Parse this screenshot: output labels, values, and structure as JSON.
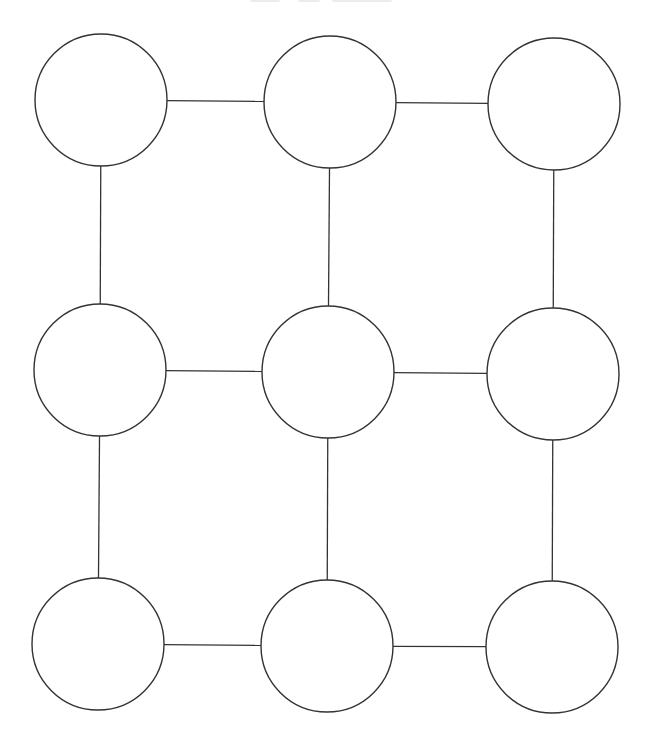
{
  "diagram": {
    "type": "grid-graph",
    "rows": 3,
    "cols": 3,
    "colors": {
      "stroke": "#333333",
      "node_fill": "#ffffff",
      "background": "#ffffff"
    },
    "node_radius": 66,
    "nodes": [
      {
        "id": "n00",
        "row": 0,
        "col": 0,
        "cx": 101,
        "cy": 100,
        "label": ""
      },
      {
        "id": "n01",
        "row": 0,
        "col": 1,
        "cx": 330,
        "cy": 102,
        "label": ""
      },
      {
        "id": "n02",
        "row": 0,
        "col": 2,
        "cx": 554,
        "cy": 104,
        "label": ""
      },
      {
        "id": "n10",
        "row": 1,
        "col": 0,
        "cx": 100,
        "cy": 370,
        "label": ""
      },
      {
        "id": "n11",
        "row": 1,
        "col": 1,
        "cx": 328,
        "cy": 372,
        "label": ""
      },
      {
        "id": "n12",
        "row": 1,
        "col": 2,
        "cx": 553,
        "cy": 374,
        "label": ""
      },
      {
        "id": "n20",
        "row": 2,
        "col": 0,
        "cx": 98,
        "cy": 644,
        "label": ""
      },
      {
        "id": "n21",
        "row": 2,
        "col": 1,
        "cx": 327,
        "cy": 646,
        "label": ""
      },
      {
        "id": "n22",
        "row": 2,
        "col": 2,
        "cx": 552,
        "cy": 647,
        "label": ""
      }
    ],
    "edges": [
      {
        "from": "n00",
        "to": "n01"
      },
      {
        "from": "n01",
        "to": "n02"
      },
      {
        "from": "n10",
        "to": "n11"
      },
      {
        "from": "n11",
        "to": "n12"
      },
      {
        "from": "n20",
        "to": "n21"
      },
      {
        "from": "n21",
        "to": "n22"
      },
      {
        "from": "n00",
        "to": "n10"
      },
      {
        "from": "n10",
        "to": "n20"
      },
      {
        "from": "n01",
        "to": "n11"
      },
      {
        "from": "n11",
        "to": "n21"
      },
      {
        "from": "n02",
        "to": "n12"
      },
      {
        "from": "n12",
        "to": "n22"
      }
    ]
  }
}
